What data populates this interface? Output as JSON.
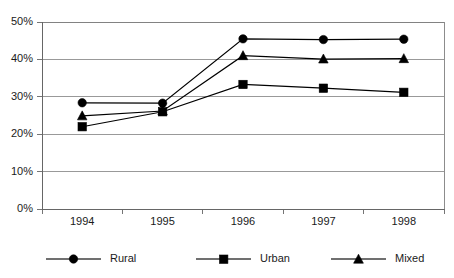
{
  "chart_data": {
    "type": "line",
    "title": "",
    "subtitle": "",
    "xlabel": "",
    "ylabel": "",
    "categories": [
      "1994",
      "1995",
      "1996",
      "1997",
      "1998"
    ],
    "series": [
      {
        "name": "Rural",
        "marker": "circle",
        "values": [
          28.4,
          28.3,
          45.5,
          45.3,
          45.4
        ]
      },
      {
        "name": "Urban",
        "marker": "square",
        "values": [
          22.0,
          26.0,
          33.3,
          32.3,
          31.2
        ]
      },
      {
        "name": "Mixed",
        "marker": "triangle",
        "values": [
          24.9,
          26.2,
          41.0,
          40.1,
          40.2
        ]
      }
    ],
    "ylim": [
      0,
      50
    ],
    "yticks": [
      0,
      10,
      20,
      30,
      40,
      50
    ],
    "ytick_labels": [
      "0%",
      "10%",
      "20%",
      "30%",
      "40%",
      "50%"
    ],
    "grid": true,
    "legend_position": "bottom",
    "colors": {
      "series": "#000000",
      "gridline": "#808080",
      "axis": "#666666",
      "legend_line": "#707070",
      "background": "#ffffff",
      "text": "#1a1a1a"
    }
  },
  "legend": {
    "items": [
      {
        "label": "Rural",
        "marker": "circle-marker-icon"
      },
      {
        "label": "Urban",
        "marker": "square-marker-icon"
      },
      {
        "label": "Mixed",
        "marker": "triangle-marker-icon"
      }
    ]
  }
}
